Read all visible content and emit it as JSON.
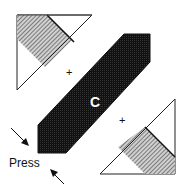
{
  "diagram": {
    "center_label": "C",
    "press_label": "Press",
    "plus_marks": [
      "+",
      "+"
    ],
    "colors": {
      "dark_fill": "#1a1a1a",
      "hatch_fill": "#9a9a9a",
      "stroke": "#111111",
      "background": "#ffffff"
    },
    "components": [
      {
        "name": "upper-left-triangle",
        "fill": "white with hatched corner band"
      },
      {
        "name": "center-diagonal-bar",
        "fill": "dark",
        "label": "C"
      },
      {
        "name": "lower-right-triangle",
        "fill": "white with hatched corner band"
      }
    ],
    "arrows": [
      {
        "name": "arrow-upper-left",
        "direction": "down-right"
      },
      {
        "name": "arrow-lower",
        "direction": "up-left"
      }
    ]
  }
}
